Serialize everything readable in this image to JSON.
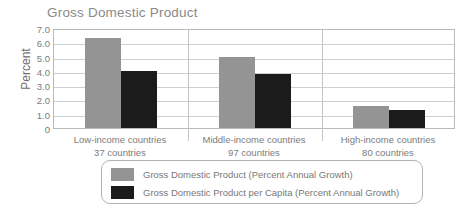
{
  "chart_data": {
    "type": "bar",
    "title": "Gross Domestic Product",
    "xlabel": "",
    "ylabel": "Percent",
    "ylim": [
      0,
      7.0
    ],
    "yticks": [
      "7.0",
      "6.0",
      "5.0",
      "4.0",
      "3.0",
      "2.0",
      "1.0",
      "0"
    ],
    "grid": true,
    "legend_position": "bottom",
    "categories": [
      "Low-income countries",
      "Middle-income countries",
      "High-income countries"
    ],
    "category_sublabels": [
      "37 countries",
      "97 countries",
      "80 countries"
    ],
    "series": [
      {
        "name": "Gross Domestic Product (Percent Annual Growth)",
        "color": "#949494",
        "values": [
          6.3,
          5.0,
          1.55
        ]
      },
      {
        "name": "Gross Domestic Product per Capita (Percent Annual Growth)",
        "color": "#1b1b1b",
        "values": [
          4.0,
          3.75,
          1.25
        ]
      }
    ]
  },
  "colors": {
    "series_gdp": "#949494",
    "series_gdp_per_capita": "#1b1b1b",
    "axis": "#b9b9b9",
    "grid": "#cfcfcf",
    "text": "#7b7b7b"
  }
}
